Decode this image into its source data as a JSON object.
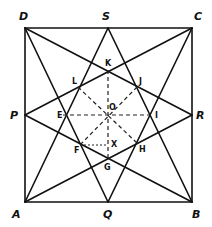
{
  "diagram": {
    "colors": {
      "line": "#111111",
      "background": "#ffffff"
    },
    "points": {
      "A": {
        "label": "A",
        "x": 25,
        "y": 202
      },
      "B": {
        "label": "B",
        "x": 192,
        "y": 202
      },
      "C": {
        "label": "C",
        "x": 192,
        "y": 28
      },
      "D": {
        "label": "D",
        "x": 25,
        "y": 28
      },
      "P": {
        "label": "P",
        "x": 25,
        "y": 115
      },
      "Q": {
        "label": "Q",
        "x": 108,
        "y": 202
      },
      "R": {
        "label": "R",
        "x": 192,
        "y": 115
      },
      "S": {
        "label": "S",
        "x": 108,
        "y": 28
      },
      "K": {
        "label": "K",
        "x": 108,
        "y": 70
      },
      "J": {
        "label": "J",
        "x": 137,
        "y": 87
      },
      "I": {
        "label": "I",
        "x": 153,
        "y": 115
      },
      "H": {
        "label": "H",
        "x": 137,
        "y": 143
      },
      "G": {
        "label": "G",
        "x": 108,
        "y": 158
      },
      "F": {
        "label": "F",
        "x": 80,
        "y": 145
      },
      "E": {
        "label": "E",
        "x": 63,
        "y": 115
      },
      "L": {
        "label": "L",
        "x": 78,
        "y": 87
      },
      "O": {
        "label": "O",
        "x": 108,
        "y": 115
      },
      "X": {
        "label": "X",
        "x": 108,
        "y": 145
      }
    },
    "labels": {
      "A": "A",
      "B": "B",
      "C": "C",
      "D": "D",
      "P": "P",
      "Q": "Q",
      "R": "R",
      "S": "S",
      "K": "K",
      "J": "J",
      "I": "I",
      "H": "H",
      "G": "G",
      "F": "F",
      "E": "E",
      "L": "L",
      "O": "O",
      "X": "X"
    },
    "solid_segments": [
      "AB",
      "BC",
      "CD",
      "DA",
      "AS",
      "SB",
      "DQ",
      "QC",
      "AR",
      "RD",
      "BP",
      "PC"
    ],
    "dashed_segments": [
      "KG",
      "EI",
      "LH",
      "JF"
    ],
    "dotted_segments": [
      "FX"
    ]
  }
}
